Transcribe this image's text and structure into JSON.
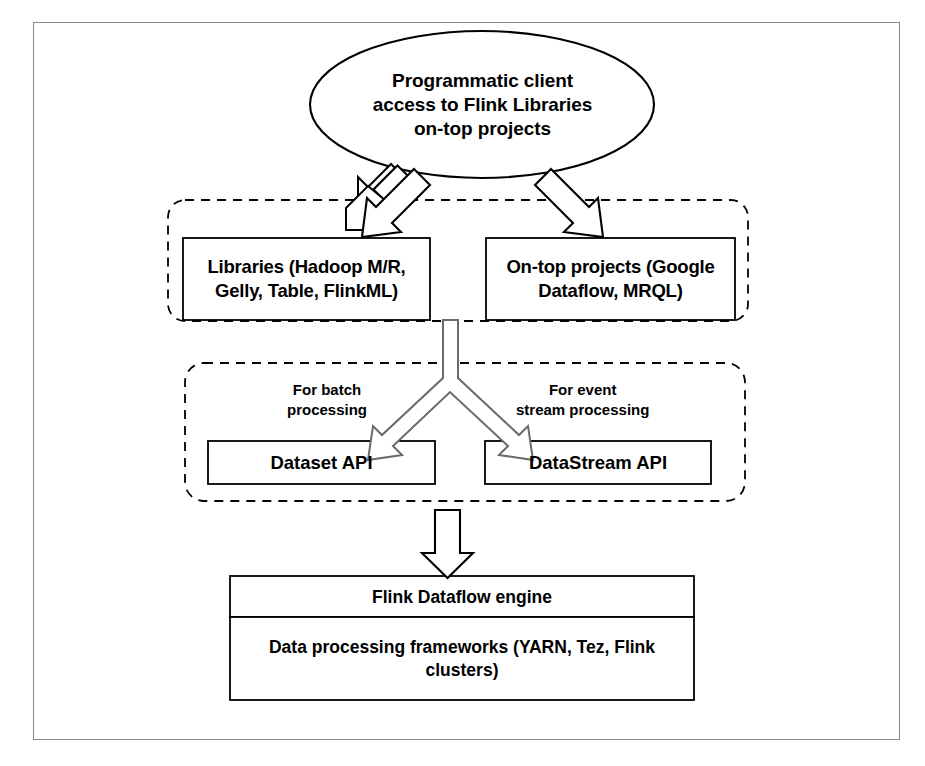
{
  "diagram": {
    "frame": {
      "border_color": "#8a8a8a"
    },
    "ellipse": {
      "label": "Programmatic client\naccess to Flink Libraries\non-top projects",
      "line1": "Programmatic client",
      "line2": "access to Flink Libraries",
      "line3": "on-top projects"
    },
    "groups": [
      {
        "id": "libraries-group",
        "style": "dashed-rounded"
      },
      {
        "id": "api-group",
        "style": "dashed-rounded"
      }
    ],
    "boxes": {
      "libraries": {
        "line1": "Libraries (Hadoop M/R,",
        "line2": "Gelly, Table, FlinkML)"
      },
      "on_top_projects": {
        "line1": "On-top projects (Google",
        "line2": "Dataflow, MRQL)"
      },
      "dataset_api": {
        "label": "Dataset API"
      },
      "datastream_api": {
        "label": "DataStream API"
      },
      "flink_engine": {
        "label": "Flink Dataflow engine"
      },
      "frameworks": {
        "line1": "Data processing frameworks (YARN, Tez, Flink",
        "line2": "clusters)"
      }
    },
    "labels": {
      "batch": {
        "line1": "For batch",
        "line2": "processing"
      },
      "stream": {
        "line1": "For event",
        "line2": "stream processing"
      }
    },
    "arrows": [
      {
        "name": "ellipse-to-libraries",
        "kind": "block-arrow-diagonal-down-left"
      },
      {
        "name": "ellipse-to-ontop",
        "kind": "block-arrow-diagonal-down-right"
      },
      {
        "name": "libraries-to-apis-split",
        "kind": "block-arrow-y-split"
      },
      {
        "name": "apis-to-engine",
        "kind": "block-arrow-down"
      }
    ],
    "colors": {
      "stroke": "#000000",
      "frame": "#8a8a8a",
      "background": "#ffffff",
      "arrow_fill": "#ffffff",
      "arrow_stroke": "#5a5a5a"
    }
  }
}
